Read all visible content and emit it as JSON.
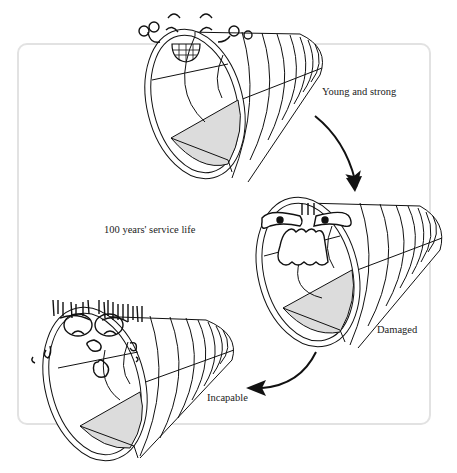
{
  "diagram": {
    "type": "tunnel-lifecycle-illustration",
    "frame_label": "100 years' service life",
    "stages": [
      {
        "id": "young",
        "label": "Young and strong",
        "face": "happy-grinning-with-glasses"
      },
      {
        "id": "damaged",
        "label": "Damaged",
        "face": "angry-frowning"
      },
      {
        "id": "incapable",
        "label": "Incapable",
        "face": "exhausted-sweating"
      }
    ],
    "arrows": [
      {
        "from": "young",
        "to": "damaged"
      },
      {
        "from": "damaged",
        "to": "incapable"
      }
    ]
  },
  "colors": {
    "line": "#111111",
    "invert_fill": "#dcdcdc",
    "frame_border": "#e2e2e2",
    "background": "#ffffff"
  }
}
